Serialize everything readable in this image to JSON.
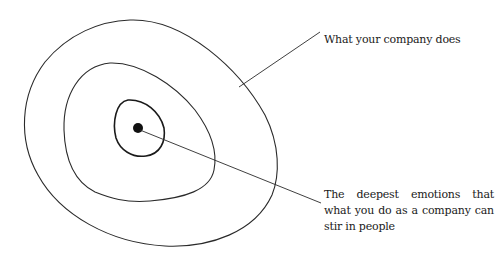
{
  "diagram": {
    "type": "concentric-circles",
    "labels": {
      "outer": "What your company does",
      "core": "The deepest emotions that what you do as a company can stir in people"
    },
    "colors": {
      "stroke": "#2a2a2a",
      "text": "#1a1a1a",
      "background": "#ffffff"
    }
  }
}
